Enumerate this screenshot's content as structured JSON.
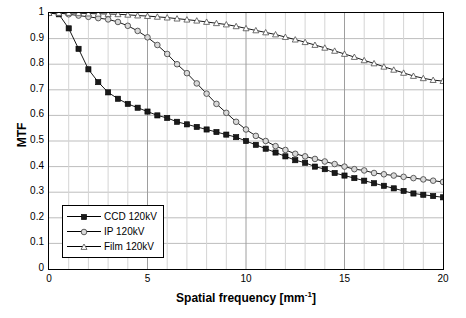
{
  "chart_data": {
    "type": "line",
    "title": "",
    "subtitle": "",
    "xlabel": "Spatial frequency [mm",
    "xlabel_sup": "-1",
    "xlabel_suffix": "]",
    "ylabel": "MTF",
    "xlim": [
      0,
      20
    ],
    "ylim": [
      0,
      1
    ],
    "grid": true,
    "legend_position": "bottom-left",
    "xticks": [
      0,
      5,
      10,
      15,
      20
    ],
    "yticks": [
      "0",
      "0.1",
      "0.2",
      "0.3",
      "0.4",
      "0.5",
      "0.6",
      "0.7",
      "0.8",
      "0.9",
      "1"
    ],
    "series": [
      {
        "name": "CCD 120kV",
        "marker": "square",
        "color": "#1a1a1a",
        "x": [
          0,
          0.5,
          1,
          1.5,
          2,
          2.5,
          3,
          3.5,
          4,
          4.5,
          5,
          5.5,
          6,
          6.5,
          7,
          7.5,
          8,
          8.5,
          9,
          9.5,
          10,
          10.5,
          11,
          11.5,
          12,
          12.5,
          13,
          13.5,
          14,
          14.5,
          15,
          15.5,
          16,
          16.5,
          17,
          17.5,
          18,
          18.5,
          19,
          19.5,
          20
        ],
        "values": [
          1.0,
          0.995,
          0.94,
          0.86,
          0.78,
          0.73,
          0.69,
          0.665,
          0.645,
          0.63,
          0.615,
          0.6,
          0.59,
          0.575,
          0.565,
          0.555,
          0.545,
          0.535,
          0.525,
          0.515,
          0.5,
          0.485,
          0.47,
          0.455,
          0.44,
          0.425,
          0.415,
          0.4,
          0.39,
          0.375,
          0.365,
          0.355,
          0.345,
          0.335,
          0.325,
          0.315,
          0.305,
          0.295,
          0.29,
          0.285,
          0.28
        ]
      },
      {
        "name": "IP 120kV",
        "marker": "circle",
        "color": "#808080",
        "x": [
          0,
          0.5,
          1,
          1.5,
          2,
          2.5,
          3,
          3.5,
          4,
          4.5,
          5,
          5.5,
          6,
          6.5,
          7,
          7.5,
          8,
          8.5,
          9,
          9.5,
          10,
          10.5,
          11,
          11.5,
          12,
          12.5,
          13,
          13.5,
          14,
          14.5,
          15,
          15.5,
          16,
          16.5,
          17,
          17.5,
          18,
          18.5,
          19,
          19.5,
          20
        ],
        "values": [
          1.0,
          1.0,
          0.995,
          0.99,
          0.985,
          0.98,
          0.975,
          0.965,
          0.95,
          0.93,
          0.905,
          0.875,
          0.84,
          0.8,
          0.765,
          0.725,
          0.685,
          0.645,
          0.61,
          0.575,
          0.545,
          0.52,
          0.5,
          0.48,
          0.465,
          0.45,
          0.44,
          0.43,
          0.42,
          0.41,
          0.4,
          0.39,
          0.385,
          0.375,
          0.37,
          0.365,
          0.36,
          0.355,
          0.35,
          0.345,
          0.34
        ]
      },
      {
        "name": "Film 120kV",
        "marker": "triangle",
        "color": "#555555",
        "x": [
          0,
          0.5,
          1,
          1.5,
          2,
          2.5,
          3,
          3.5,
          4,
          4.5,
          5,
          5.5,
          6,
          6.5,
          7,
          7.5,
          8,
          8.5,
          9,
          9.5,
          10,
          10.5,
          11,
          11.5,
          12,
          12.5,
          13,
          13.5,
          14,
          14.5,
          15,
          15.5,
          16,
          16.5,
          17,
          17.5,
          18,
          18.5,
          19,
          19.5,
          20
        ],
        "values": [
          1.0,
          1.0,
          1.0,
          0.999,
          0.998,
          0.997,
          0.996,
          0.995,
          0.993,
          0.99,
          0.988,
          0.985,
          0.982,
          0.978,
          0.974,
          0.97,
          0.965,
          0.96,
          0.955,
          0.948,
          0.94,
          0.932,
          0.924,
          0.916,
          0.906,
          0.896,
          0.886,
          0.875,
          0.864,
          0.852,
          0.84,
          0.828,
          0.815,
          0.803,
          0.79,
          0.778,
          0.766,
          0.754,
          0.745,
          0.738,
          0.734
        ]
      }
    ],
    "legend": [
      {
        "label": "CCD 120kV",
        "marker": "square"
      },
      {
        "label": "IP 120kV",
        "marker": "circle"
      },
      {
        "label": "Film 120kV",
        "marker": "triangle"
      }
    ]
  }
}
